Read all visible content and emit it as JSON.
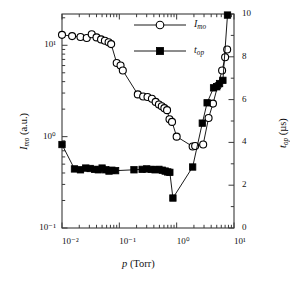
{
  "chart_data": {
    "type": "line",
    "title": "",
    "xlabel": "p (Torr)",
    "ylabel": "I_mo (a.u.)",
    "y2label": "t_op (µs)",
    "xscale": "log",
    "yscale": "log",
    "y2scale": "linear",
    "xlim": [
      0.01,
      10
    ],
    "ylim": [
      0.1,
      22
    ],
    "y2lim": [
      0,
      10
    ],
    "grid": false,
    "legend_position": "top-center",
    "x_ticklabels": [
      "10⁻²",
      "10⁻¹",
      "10⁰",
      "10¹"
    ],
    "x_tickvalues": [
      0.01,
      0.1,
      1,
      10
    ],
    "y_ticklabels": [
      "10⁻¹",
      "10⁰",
      "10¹"
    ],
    "y_tickvalues": [
      0.1,
      1,
      10
    ],
    "y2_ticklabels": [
      "0",
      "2",
      "4",
      "6",
      "8",
      "10"
    ],
    "y2_tickvalues": [
      0,
      2,
      4,
      6,
      8,
      10
    ],
    "series": [
      {
        "name": "I_mo",
        "label": "I_mo",
        "marker": "open-circle",
        "axis": "left",
        "color": "#000000",
        "points": [
          [
            0.01,
            13.0
          ],
          [
            0.015,
            12.6
          ],
          [
            0.021,
            12.3
          ],
          [
            0.027,
            12.0
          ],
          [
            0.033,
            13.2
          ],
          [
            0.04,
            12.2
          ],
          [
            0.048,
            11.6
          ],
          [
            0.056,
            11.2
          ],
          [
            0.065,
            10.8
          ],
          [
            0.072,
            10.3
          ],
          [
            0.09,
            6.4
          ],
          [
            0.105,
            6.0
          ],
          [
            0.115,
            5.3
          ],
          [
            0.21,
            2.9
          ],
          [
            0.26,
            2.75
          ],
          [
            0.31,
            2.72
          ],
          [
            0.37,
            2.6
          ],
          [
            0.43,
            2.4
          ],
          [
            0.49,
            2.25
          ],
          [
            0.55,
            2.15
          ],
          [
            0.61,
            2.05
          ],
          [
            0.68,
            1.95
          ],
          [
            0.75,
            1.55
          ],
          [
            0.83,
            1.45
          ],
          [
            1.0,
            1.0
          ],
          [
            1.9,
            0.78
          ],
          [
            2.1,
            0.79
          ],
          [
            2.9,
            0.82
          ],
          [
            3.6,
            1.6
          ],
          [
            4.3,
            2.3
          ],
          [
            5.2,
            3.6
          ],
          [
            6.2,
            5.3
          ],
          [
            7.0,
            7.4
          ],
          [
            7.6,
            9.0
          ]
        ]
      },
      {
        "name": "t_op",
        "label": "t_op",
        "marker": "filled-square",
        "axis": "right",
        "color": "#000000",
        "points": [
          [
            0.01,
            3.9
          ],
          [
            0.0165,
            2.76
          ],
          [
            0.021,
            2.72
          ],
          [
            0.026,
            2.8
          ],
          [
            0.031,
            2.78
          ],
          [
            0.037,
            2.74
          ],
          [
            0.043,
            2.72
          ],
          [
            0.05,
            2.8
          ],
          [
            0.058,
            2.72
          ],
          [
            0.066,
            2.66
          ],
          [
            0.074,
            2.7
          ],
          [
            0.086,
            2.68
          ],
          [
            0.18,
            2.72
          ],
          [
            0.25,
            2.74
          ],
          [
            0.3,
            2.76
          ],
          [
            0.36,
            2.74
          ],
          [
            0.42,
            2.72
          ],
          [
            0.49,
            2.74
          ],
          [
            0.56,
            2.7
          ],
          [
            0.63,
            2.66
          ],
          [
            0.7,
            2.62
          ],
          [
            0.76,
            2.6
          ],
          [
            0.86,
            1.4
          ],
          [
            1.9,
            2.85
          ],
          [
            2.8,
            4.9
          ],
          [
            3.4,
            5.85
          ],
          [
            4.4,
            6.55
          ],
          [
            5.0,
            6.6
          ],
          [
            5.6,
            6.75
          ],
          [
            6.4,
            6.9
          ],
          [
            7.7,
            9.95
          ]
        ]
      }
    ]
  },
  "axes": {
    "x": {
      "label_main": "p",
      "label_unit": "(Torr)"
    },
    "y_left": {
      "label_main": "I",
      "label_sub": "mo",
      "label_unit": "(a.u.)"
    },
    "y_right": {
      "label_main": "t",
      "label_sub": "op",
      "label_unit": "(µs)"
    }
  },
  "legend": {
    "items": [
      {
        "marker": "open-circle",
        "symbol_name": "open-circle-marker",
        "text_main": "I",
        "text_sub": "mo"
      },
      {
        "marker": "filled-square",
        "symbol_name": "filled-square-marker",
        "text_main": "t",
        "text_sub": "op"
      }
    ]
  }
}
